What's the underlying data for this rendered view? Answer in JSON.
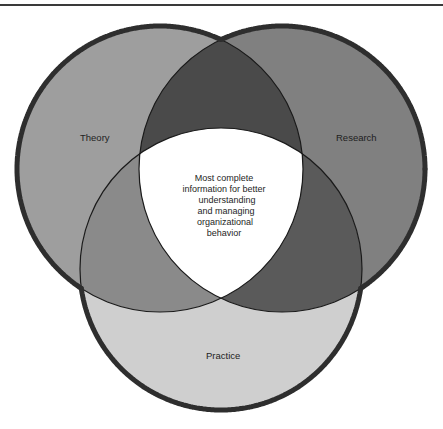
{
  "diagram": {
    "type": "venn",
    "sets": [
      {
        "id": "theory",
        "label": "Theory",
        "color": "#9e9e9e"
      },
      {
        "id": "research",
        "label": "Research",
        "color": "#808080"
      },
      {
        "id": "practice",
        "label": "Practice",
        "color": "#cfcfcf"
      }
    ],
    "intersections": {
      "theory_research": {
        "color": "#4a4a4a"
      },
      "theory_practice": {
        "color": "#8a8a8a"
      },
      "research_practice": {
        "color": "#5a5a5a"
      },
      "all": {
        "color": "#ffffff",
        "label_lines": [
          "Most complete",
          "information for better",
          "understanding",
          "and managing",
          "organizational",
          "behavior"
        ]
      }
    },
    "outline_color": "#2e2e2e"
  }
}
